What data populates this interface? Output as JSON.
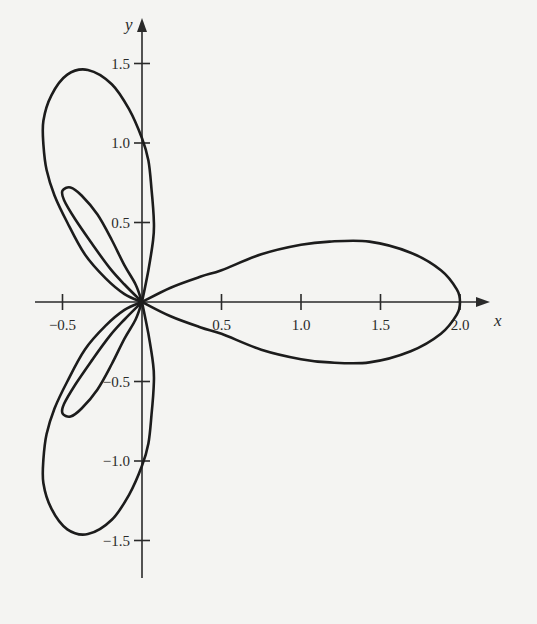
{
  "chart_data": {
    "type": "line",
    "title": "",
    "xlabel": "x",
    "ylabel": "y",
    "xlim": [
      -0.6,
      2.4
    ],
    "ylim": [
      -1.75,
      1.8
    ],
    "grid": false,
    "legend": null,
    "x_ticks": [
      {
        "value": -0.5,
        "label": "−0.5"
      },
      {
        "value": 0.5,
        "label": "0.5"
      },
      {
        "value": 1.0,
        "label": "1.0"
      },
      {
        "value": 1.5,
        "label": "1.5"
      },
      {
        "value": 2.0,
        "label": "2.0"
      }
    ],
    "y_ticks": [
      {
        "value": 1.5,
        "label": "1.5"
      },
      {
        "value": 1.0,
        "label": "1.0"
      },
      {
        "value": 0.5,
        "label": "0.5"
      },
      {
        "value": -0.5,
        "label": "−0.5"
      },
      {
        "value": -1.0,
        "label": "−1.0"
      },
      {
        "value": -1.5,
        "label": "−1.5"
      }
    ],
    "series": [
      {
        "name": "right-petal",
        "points": [
          [
            0,
            0
          ],
          [
            0.18,
            0.09
          ],
          [
            0.37,
            0.16
          ],
          [
            0.5,
            0.2
          ],
          [
            0.75,
            0.3
          ],
          [
            1.0,
            0.36
          ],
          [
            1.18,
            0.38
          ],
          [
            1.43,
            0.38
          ],
          [
            1.69,
            0.31
          ],
          [
            1.88,
            0.2
          ],
          [
            1.98,
            0.08
          ],
          [
            2.0,
            0
          ],
          [
            1.98,
            -0.08
          ],
          [
            1.88,
            -0.2
          ],
          [
            1.69,
            -0.31
          ],
          [
            1.43,
            -0.38
          ],
          [
            1.18,
            -0.38
          ],
          [
            1.0,
            -0.36
          ],
          [
            0.75,
            -0.3
          ],
          [
            0.5,
            -0.2
          ],
          [
            0.37,
            -0.16
          ],
          [
            0.18,
            -0.09
          ],
          [
            0,
            0
          ]
        ]
      },
      {
        "name": "upper-large-lobe",
        "points": [
          [
            0,
            0
          ],
          [
            0.04,
            0.2
          ],
          [
            0.07,
            0.39
          ],
          [
            0.075,
            0.5
          ],
          [
            0.06,
            0.71
          ],
          [
            0.04,
            0.89
          ],
          [
            0.0,
            1.03
          ],
          [
            -0.08,
            1.21
          ],
          [
            -0.19,
            1.37
          ],
          [
            -0.34,
            1.46
          ],
          [
            -0.47,
            1.43
          ],
          [
            -0.57,
            1.3
          ],
          [
            -0.62,
            1.14
          ],
          [
            -0.62,
            0.99
          ],
          [
            -0.6,
            0.83
          ],
          [
            -0.55,
            0.67
          ],
          [
            -0.47,
            0.5
          ],
          [
            -0.36,
            0.3
          ],
          [
            -0.23,
            0.15
          ],
          [
            -0.11,
            0.05
          ],
          [
            0,
            0
          ]
        ]
      },
      {
        "name": "upper-inner-loop",
        "points": [
          [
            0,
            0
          ],
          [
            -0.11,
            0.11
          ],
          [
            -0.2,
            0.21
          ],
          [
            -0.31,
            0.36
          ],
          [
            -0.42,
            0.52
          ],
          [
            -0.49,
            0.64
          ],
          [
            -0.5,
            0.7
          ],
          [
            -0.45,
            0.72
          ],
          [
            -0.38,
            0.67
          ],
          [
            -0.28,
            0.55
          ],
          [
            -0.19,
            0.39
          ],
          [
            -0.11,
            0.23
          ],
          [
            -0.04,
            0.11
          ],
          [
            0,
            0
          ]
        ]
      },
      {
        "name": "lower-large-lobe",
        "points": [
          [
            0,
            0
          ],
          [
            0.04,
            -0.2
          ],
          [
            0.07,
            -0.39
          ],
          [
            0.075,
            -0.5
          ],
          [
            0.06,
            -0.71
          ],
          [
            0.04,
            -0.89
          ],
          [
            0.0,
            -1.03
          ],
          [
            -0.08,
            -1.21
          ],
          [
            -0.19,
            -1.37
          ],
          [
            -0.34,
            -1.46
          ],
          [
            -0.47,
            -1.43
          ],
          [
            -0.57,
            -1.3
          ],
          [
            -0.62,
            -1.14
          ],
          [
            -0.62,
            -0.99
          ],
          [
            -0.6,
            -0.83
          ],
          [
            -0.55,
            -0.67
          ],
          [
            -0.47,
            -0.5
          ],
          [
            -0.36,
            -0.3
          ],
          [
            -0.23,
            -0.15
          ],
          [
            -0.11,
            -0.05
          ],
          [
            0,
            0
          ]
        ]
      },
      {
        "name": "lower-inner-loop",
        "points": [
          [
            0,
            0
          ],
          [
            -0.11,
            -0.11
          ],
          [
            -0.2,
            -0.21
          ],
          [
            -0.31,
            -0.36
          ],
          [
            -0.42,
            -0.52
          ],
          [
            -0.49,
            -0.64
          ],
          [
            -0.5,
            -0.7
          ],
          [
            -0.45,
            -0.72
          ],
          [
            -0.38,
            -0.67
          ],
          [
            -0.28,
            -0.55
          ],
          [
            -0.19,
            -0.39
          ],
          [
            -0.11,
            -0.23
          ],
          [
            -0.04,
            -0.11
          ],
          [
            0,
            0
          ]
        ]
      }
    ]
  },
  "plot": {
    "origin_px": [
      142,
      302
    ],
    "scale_px_per_unit": 159,
    "x_axis": {
      "from_px": 35,
      "to_px": 490
    },
    "y_axis": {
      "from_px": 578,
      "to_px": 18
    },
    "axis_labels": {
      "x": "x",
      "y": "y"
    }
  }
}
